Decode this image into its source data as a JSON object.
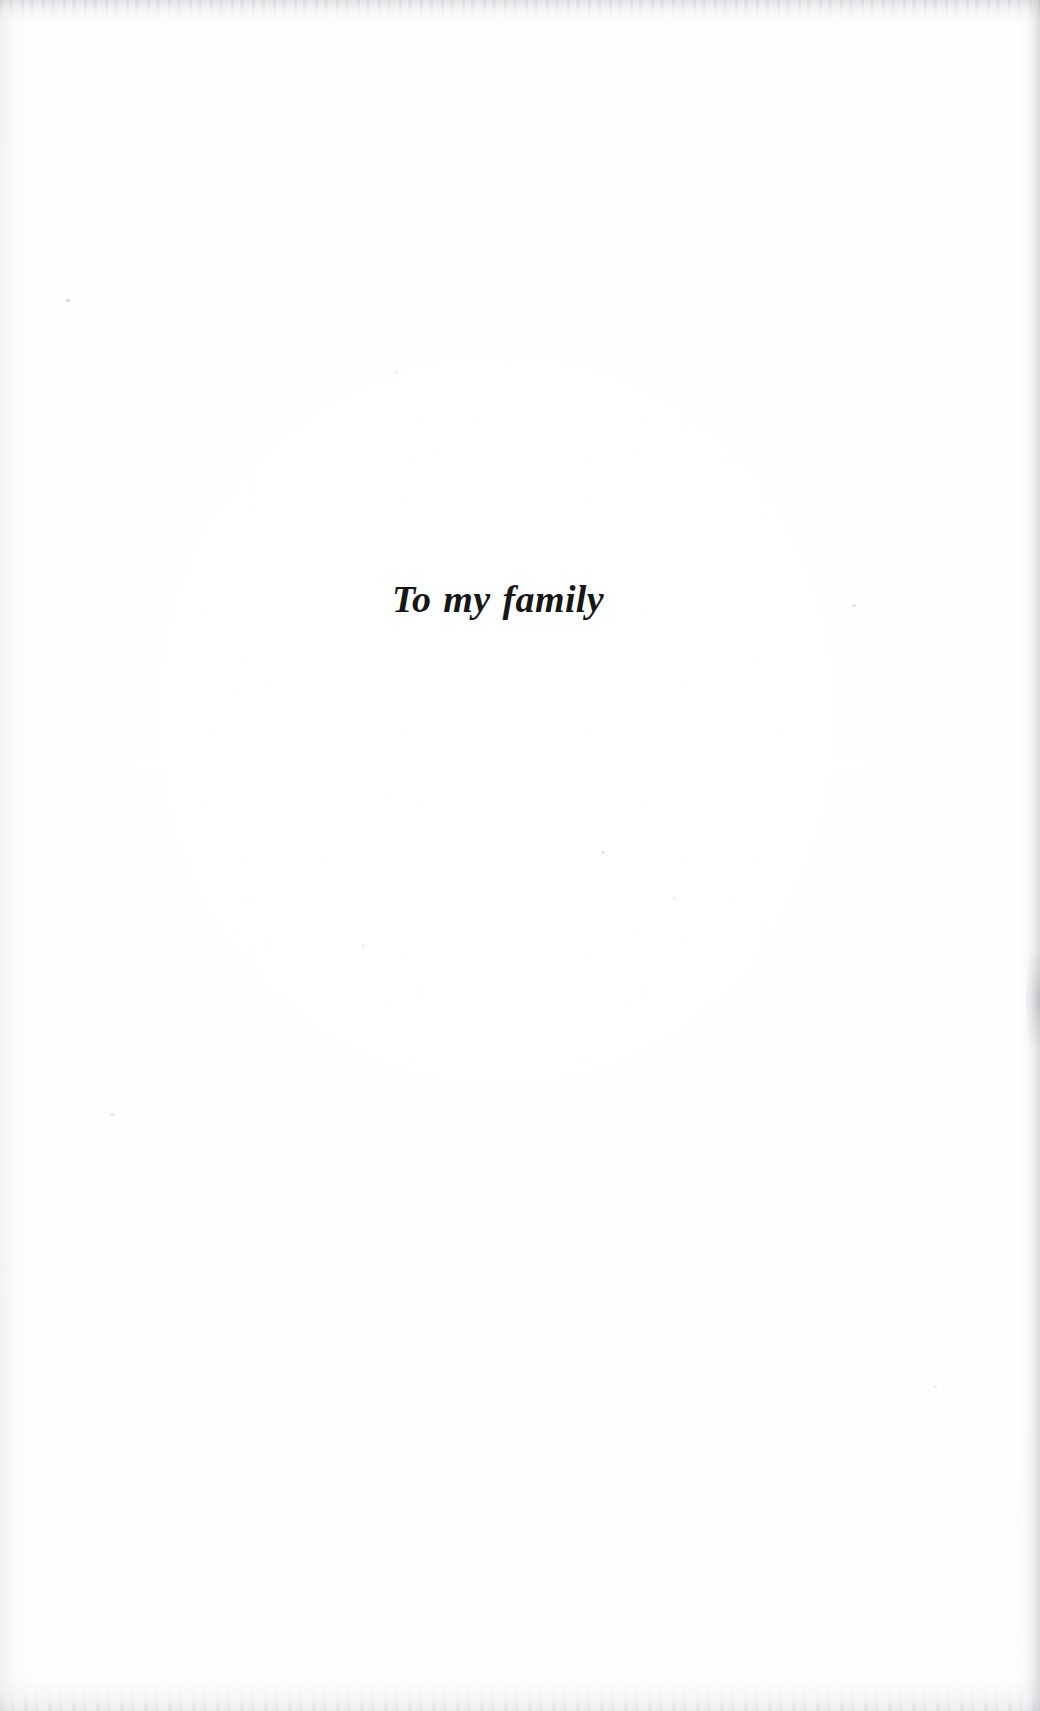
{
  "page": {
    "kind": "book-dedication-page",
    "paper_color": "#fefefe",
    "ink_color": "#171717",
    "width_px": 1040,
    "height_px": 1711
  },
  "dedication": {
    "text": "To my family"
  }
}
